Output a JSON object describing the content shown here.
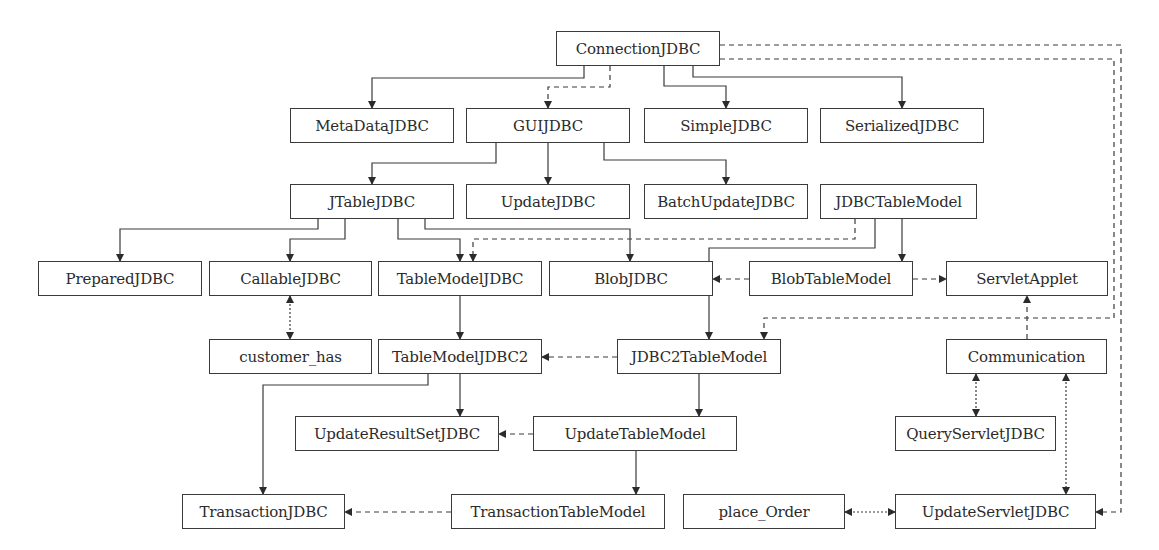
{
  "diagram": {
    "colors": {
      "line": "#3a3a3a",
      "text": "#2b2b2b",
      "background": "#ffffff"
    },
    "nodes": [
      {
        "id": "ConnectionJDBC",
        "label": "ConnectionJDBC",
        "x": 556,
        "y": 31,
        "w": 164,
        "h": 35
      },
      {
        "id": "MetaDataJDBC",
        "label": "MetaDataJDBC",
        "x": 290,
        "y": 108,
        "w": 164,
        "h": 35
      },
      {
        "id": "GUIJDBC",
        "label": "GUIJDBC",
        "x": 466,
        "y": 108,
        "w": 164,
        "h": 35
      },
      {
        "id": "SimpleJDBC",
        "label": "SimpleJDBC",
        "x": 644,
        "y": 108,
        "w": 164,
        "h": 35
      },
      {
        "id": "SerializedJDBC",
        "label": "SerializedJDBC",
        "x": 820,
        "y": 108,
        "w": 164,
        "h": 35
      },
      {
        "id": "JTableJDBC",
        "label": "JTableJDBC",
        "x": 290,
        "y": 184,
        "w": 164,
        "h": 35
      },
      {
        "id": "UpdateJDBC",
        "label": "UpdateJDBC",
        "x": 466,
        "y": 184,
        "w": 164,
        "h": 35
      },
      {
        "id": "BatchUpdateJDBC",
        "label": "BatchUpdateJDBC",
        "x": 644,
        "y": 184,
        "w": 164,
        "h": 35
      },
      {
        "id": "JDBCTableModel",
        "label": "JDBCTableModel",
        "x": 820,
        "y": 184,
        "w": 157,
        "h": 35
      },
      {
        "id": "PreparedJDBC",
        "label": "PreparedJDBC",
        "x": 38,
        "y": 261,
        "w": 164,
        "h": 35
      },
      {
        "id": "CallableJDBC",
        "label": "CallableJDBC",
        "x": 209,
        "y": 261,
        "w": 163,
        "h": 35
      },
      {
        "id": "TableModelJDBC",
        "label": "TableModelJDBC",
        "x": 378,
        "y": 261,
        "w": 164,
        "h": 35
      },
      {
        "id": "BlobJDBC",
        "label": "BlobJDBC",
        "x": 549,
        "y": 261,
        "w": 164,
        "h": 35
      },
      {
        "id": "BlobTableModel",
        "label": "BlobTableModel",
        "x": 749,
        "y": 261,
        "w": 164,
        "h": 35
      },
      {
        "id": "ServletApplet",
        "label": "ServletApplet",
        "x": 946,
        "y": 261,
        "w": 162,
        "h": 35
      },
      {
        "id": "customer_has",
        "label": "customer_has",
        "x": 209,
        "y": 339,
        "w": 163,
        "h": 35
      },
      {
        "id": "TableModelJDBC2",
        "label": "TableModelJDBC2",
        "x": 378,
        "y": 339,
        "w": 164,
        "h": 35
      },
      {
        "id": "JDBC2TableModel",
        "label": "JDBC2TableModel",
        "x": 617,
        "y": 339,
        "w": 164,
        "h": 35
      },
      {
        "id": "Communication",
        "label": "Communication",
        "x": 946,
        "y": 339,
        "w": 161,
        "h": 35
      },
      {
        "id": "UpdateResultSetJDBC",
        "label": "UpdateResultSetJDBC",
        "x": 295,
        "y": 416,
        "w": 204,
        "h": 35
      },
      {
        "id": "UpdateTableModel",
        "label": "UpdateTableModel",
        "x": 533,
        "y": 416,
        "w": 204,
        "h": 35
      },
      {
        "id": "QueryServletJDBC",
        "label": "QueryServletJDBC",
        "x": 895,
        "y": 416,
        "w": 161,
        "h": 35
      },
      {
        "id": "TransactionJDBC",
        "label": "TransactionJDBC",
        "x": 182,
        "y": 494,
        "w": 163,
        "h": 35
      },
      {
        "id": "TransactionTableModel",
        "label": "TransactionTableModel",
        "x": 451,
        "y": 494,
        "w": 214,
        "h": 35
      },
      {
        "id": "place_Order",
        "label": "place_Order",
        "x": 683,
        "y": 494,
        "w": 162,
        "h": 35
      },
      {
        "id": "UpdateServletJDBC",
        "label": "UpdateServletJDBC",
        "x": 895,
        "y": 494,
        "w": 201,
        "h": 35
      }
    ],
    "edges": [
      {
        "from": "ConnectionJDBC",
        "to": "MetaDataJDBC",
        "style": "solid",
        "points": [
          [
            584,
            66
          ],
          [
            584,
            78
          ],
          [
            372,
            78
          ],
          [
            372,
            108
          ]
        ],
        "arrow_end": true
      },
      {
        "from": "ConnectionJDBC",
        "to": "GUIJDBC",
        "style": "dashed",
        "points": [
          [
            610,
            66
          ],
          [
            610,
            87
          ],
          [
            548,
            87
          ],
          [
            548,
            108
          ]
        ],
        "arrow_end": true
      },
      {
        "from": "ConnectionJDBC",
        "to": "SimpleJDBC",
        "style": "solid",
        "points": [
          [
            664,
            66
          ],
          [
            664,
            86
          ],
          [
            726,
            86
          ],
          [
            726,
            108
          ]
        ],
        "arrow_end": true
      },
      {
        "from": "ConnectionJDBC",
        "to": "SerializedJDBC",
        "style": "solid",
        "points": [
          [
            693,
            66
          ],
          [
            693,
            77
          ],
          [
            902,
            77
          ],
          [
            902,
            108
          ]
        ],
        "arrow_end": true
      },
      {
        "from": "ConnectionJDBC",
        "to": "UpdateServletJDBC",
        "style": "dashed",
        "points": [
          [
            720,
            45
          ],
          [
            1121,
            45
          ],
          [
            1121,
            512
          ],
          [
            1096,
            512
          ]
        ],
        "arrow_end": true
      },
      {
        "from": "ConnectionJDBC",
        "to": "JDBC2TableModel",
        "style": "dashed",
        "points": [
          [
            720,
            59
          ],
          [
            1114,
            59
          ],
          [
            1114,
            318
          ],
          [
            764,
            318
          ],
          [
            764,
            339
          ]
        ],
        "arrow_end": true
      },
      {
        "from": "GUIJDBC",
        "to": "JTableJDBC",
        "style": "solid",
        "points": [
          [
            496,
            143
          ],
          [
            496,
            163
          ],
          [
            372,
            163
          ],
          [
            372,
            184
          ]
        ],
        "arrow_end": true
      },
      {
        "from": "GUIJDBC",
        "to": "UpdateJDBC",
        "style": "solid",
        "points": [
          [
            548,
            143
          ],
          [
            548,
            184
          ]
        ],
        "arrow_end": true
      },
      {
        "from": "GUIJDBC",
        "to": "BatchUpdateJDBC",
        "style": "solid",
        "points": [
          [
            604,
            143
          ],
          [
            604,
            160
          ],
          [
            726,
            160
          ],
          [
            726,
            184
          ]
        ],
        "arrow_end": true
      },
      {
        "from": "JTableJDBC",
        "to": "PreparedJDBC",
        "style": "solid",
        "points": [
          [
            318,
            219
          ],
          [
            318,
            229
          ],
          [
            120,
            229
          ],
          [
            120,
            261
          ]
        ],
        "arrow_end": true
      },
      {
        "from": "JTableJDBC",
        "to": "CallableJDBC",
        "style": "solid",
        "points": [
          [
            345,
            219
          ],
          [
            345,
            239
          ],
          [
            290,
            239
          ],
          [
            290,
            261
          ]
        ],
        "arrow_end": true
      },
      {
        "from": "JTableJDBC",
        "to": "TableModelJDBC",
        "style": "solid",
        "points": [
          [
            398,
            219
          ],
          [
            398,
            239
          ],
          [
            460,
            239
          ],
          [
            460,
            261
          ]
        ],
        "arrow_end": true
      },
      {
        "from": "JTableJDBC",
        "to": "BlobJDBC",
        "style": "solid",
        "points": [
          [
            425,
            219
          ],
          [
            425,
            229
          ],
          [
            630,
            229
          ],
          [
            630,
            261
          ]
        ],
        "arrow_end": true
      },
      {
        "from": "JDBCTableModel",
        "to": "TableModelJDBC",
        "style": "dashed",
        "points": [
          [
            855,
            219
          ],
          [
            855,
            239
          ],
          [
            473,
            239
          ],
          [
            473,
            261
          ]
        ],
        "arrow_end": true
      },
      {
        "from": "JDBCTableModel",
        "to": "JDBC2TableModel",
        "style": "solid",
        "points": [
          [
            875,
            219
          ],
          [
            875,
            248
          ],
          [
            709,
            248
          ],
          [
            709,
            339
          ]
        ],
        "arrow_end": true
      },
      {
        "from": "JDBCTableModel",
        "to": "BlobTableModel",
        "style": "solid",
        "points": [
          [
            902,
            219
          ],
          [
            902,
            261
          ]
        ],
        "arrow_end": true
      },
      {
        "from": "BlobTableModel",
        "to": "BlobJDBC",
        "style": "dashed",
        "points": [
          [
            749,
            279
          ],
          [
            713,
            279
          ]
        ],
        "arrow_end": true
      },
      {
        "from": "BlobTableModel",
        "to": "ServletApplet",
        "style": "dashed",
        "points": [
          [
            913,
            279
          ],
          [
            946,
            279
          ]
        ],
        "arrow_end": true
      },
      {
        "from": "CallableJDBC",
        "to": "customer_has",
        "style": "dotted",
        "points": [
          [
            290,
            296
          ],
          [
            290,
            339
          ]
        ],
        "arrow_start": true,
        "arrow_end": true
      },
      {
        "from": "TableModelJDBC",
        "to": "TableModelJDBC2",
        "style": "solid",
        "points": [
          [
            460,
            296
          ],
          [
            460,
            339
          ]
        ],
        "arrow_end": true
      },
      {
        "from": "Communication",
        "to": "ServletApplet",
        "style": "dashed",
        "points": [
          [
            1027,
            339
          ],
          [
            1027,
            296
          ]
        ],
        "arrow_end": true
      },
      {
        "from": "JDBC2TableModel",
        "to": "TableModelJDBC2",
        "style": "dashed",
        "points": [
          [
            617,
            357
          ],
          [
            542,
            357
          ]
        ],
        "arrow_end": true
      },
      {
        "from": "TableModelJDBC2",
        "to": "TransactionJDBC",
        "style": "solid",
        "points": [
          [
            428,
            374
          ],
          [
            428,
            385
          ],
          [
            263,
            385
          ],
          [
            263,
            494
          ]
        ],
        "arrow_end": true
      },
      {
        "from": "TableModelJDBC2",
        "to": "UpdateResultSetJDBC",
        "style": "solid",
        "points": [
          [
            460,
            374
          ],
          [
            460,
            416
          ]
        ],
        "arrow_end": true
      },
      {
        "from": "JDBC2TableModel",
        "to": "UpdateTableModel",
        "style": "solid",
        "points": [
          [
            699,
            374
          ],
          [
            699,
            416
          ]
        ],
        "arrow_end": true
      },
      {
        "from": "UpdateTableModel",
        "to": "UpdateResultSetJDBC",
        "style": "dashed",
        "points": [
          [
            533,
            434
          ],
          [
            499,
            434
          ]
        ],
        "arrow_end": true
      },
      {
        "from": "UpdateTableModel",
        "to": "TransactionTableModel",
        "style": "solid",
        "points": [
          [
            636,
            451
          ],
          [
            636,
            494
          ]
        ],
        "arrow_end": true
      },
      {
        "from": "TransactionTableModel",
        "to": "TransactionJDBC",
        "style": "dashed",
        "points": [
          [
            451,
            512
          ],
          [
            345,
            512
          ]
        ],
        "arrow_end": true
      },
      {
        "from": "Communication",
        "to": "QueryServletJDBC",
        "style": "dotted",
        "points": [
          [
            976,
            374
          ],
          [
            976,
            416
          ]
        ],
        "arrow_start": true,
        "arrow_end": true
      },
      {
        "from": "Communication",
        "to": "UpdateServletJDBC",
        "style": "dotted",
        "points": [
          [
            1066,
            374
          ],
          [
            1066,
            494
          ]
        ],
        "arrow_start": true,
        "arrow_end": true
      },
      {
        "from": "place_Order",
        "to": "UpdateServletJDBC",
        "style": "dotted",
        "points": [
          [
            845,
            512
          ],
          [
            895,
            512
          ]
        ],
        "arrow_start": true,
        "arrow_end": true
      }
    ]
  }
}
